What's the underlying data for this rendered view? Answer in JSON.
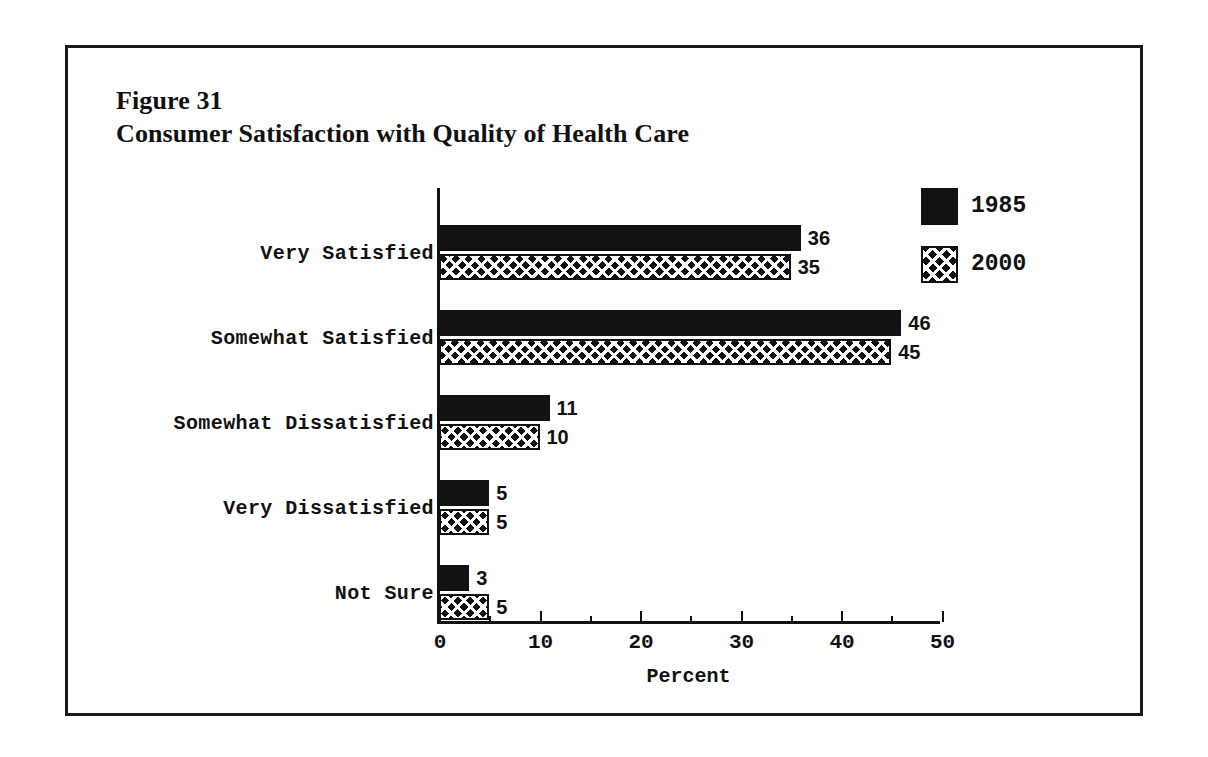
{
  "figure": {
    "number_label": "Figure 31",
    "title": "Consumer Satisfaction with Quality of Health Care",
    "frame_color": "#1a1a1a",
    "background": "#ffffff"
  },
  "chart_data": {
    "type": "bar",
    "orientation": "horizontal",
    "title": "Consumer Satisfaction with Quality of Health Care",
    "subtitle": "Figure 31",
    "xlabel": "Percent",
    "ylabel": "",
    "xlim": [
      0,
      50
    ],
    "xticks": [
      0,
      10,
      20,
      30,
      40,
      50
    ],
    "xtick_labels": [
      "0",
      "10",
      "20",
      "30",
      "40",
      "50"
    ],
    "minor_xticks": [
      5,
      15,
      25,
      35,
      45
    ],
    "grid": false,
    "legend_position": "top-right",
    "categories": [
      "Very Satisfied",
      "Somewhat Satisfied",
      "Somewhat Dissatisfied",
      "Very Dissatisfied",
      "Not Sure"
    ],
    "series": [
      {
        "name": "1985",
        "pattern": "solid",
        "color": "#111111",
        "values": [
          36,
          46,
          11,
          5,
          3
        ]
      },
      {
        "name": "2000",
        "pattern": "cross-hatch",
        "color": "#111111",
        "values": [
          35,
          45,
          10,
          5,
          5
        ]
      }
    ],
    "data_labels": {
      "1985": [
        "36",
        "46",
        "11",
        "5",
        "3"
      ],
      "2000": [
        "35",
        "45",
        "10",
        "5",
        "5"
      ]
    }
  },
  "legend": {
    "entries": [
      {
        "label": "1985",
        "pattern": "solid"
      },
      {
        "label": "2000",
        "pattern": "cross-hatch"
      }
    ]
  }
}
